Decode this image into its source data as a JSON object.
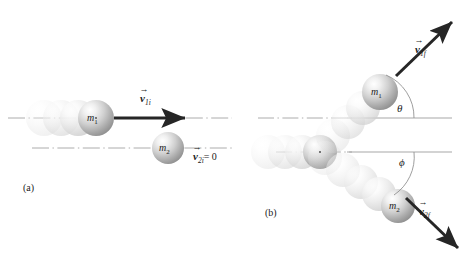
{
  "figure": {
    "type": "physics-diagram",
    "background_color": "#ffffff",
    "ink_color": "#1c1c1c",
    "sphere_color_dark": "#9a9a9a",
    "sphere_color_light": "#f2f2f2",
    "axis_color": "#9d9d9d"
  },
  "panels": [
    {
      "tag": "(a)",
      "caption_position": "bottom-left",
      "axes": [
        {
          "name": "m1-path-axis",
          "style": "dash-dot",
          "y": 118,
          "x1": 8,
          "x2": 232
        },
        {
          "name": "m2-path-axis",
          "style": "dash-dot",
          "y": 148,
          "x1": 32,
          "x2": 232
        }
      ],
      "balls": [
        {
          "label": "",
          "mass": "m1",
          "trail": true,
          "opacity": 0.12,
          "cx": 44,
          "cy": 118,
          "r": 18
        },
        {
          "label": "",
          "mass": "m1",
          "trail": true,
          "opacity": 0.28,
          "cx": 61,
          "cy": 118,
          "r": 18
        },
        {
          "label": "",
          "mass": "m1",
          "trail": true,
          "opacity": 0.52,
          "cx": 78,
          "cy": 118,
          "r": 18
        },
        {
          "label": "m1",
          "mass": "m1",
          "trail": false,
          "opacity": 1.0,
          "cx": 96,
          "cy": 118,
          "r": 18
        },
        {
          "label": "m2",
          "mass": "m2",
          "trail": false,
          "opacity": 1.0,
          "cx": 168,
          "cy": 148,
          "r": 16
        }
      ],
      "vectors": [
        {
          "name": "v1i",
          "label_html": "v1i",
          "x1": 114,
          "y1": 118,
          "x2": 188,
          "y2": 118,
          "thick": true
        }
      ],
      "labels": {
        "m1": "m",
        "m1_sub": "1",
        "m2": "m",
        "m2_sub": "2",
        "v1i_symbol": "v",
        "v1i_sub": "1i",
        "v2i_symbol": "v",
        "v2i_sub": "2i",
        "v2i_value": "= 0"
      }
    },
    {
      "tag": "(b)",
      "caption_position": "bottom-left",
      "axes": [
        {
          "name": "m1-reference-axis",
          "style": "solid",
          "y": 118,
          "x1": 345,
          "x2": 452
        },
        {
          "name": "m1-incoming-axis",
          "style": "dash-dot",
          "y": 118,
          "x1": 258,
          "x2": 352
        },
        {
          "name": "m2-reference-axis",
          "style": "solid",
          "y": 152,
          "x1": 345,
          "x2": 452
        },
        {
          "name": "m2-incoming-axis",
          "style": "dash-dot",
          "y": 152,
          "x1": 282,
          "x2": 352
        }
      ],
      "angles": [
        {
          "name": "theta",
          "symbol": "θ",
          "vertex_x": 415,
          "vertex_y": 118,
          "opens": "above-left",
          "measured_from": "horizontal"
        },
        {
          "name": "phi",
          "symbol": "ϕ",
          "vertex_x": 415,
          "vertex_y": 152,
          "opens": "below-left",
          "measured_from": "horizontal"
        }
      ],
      "vectors": [
        {
          "name": "v1f",
          "label_html": "v1f",
          "x1": 398,
          "y1": 74,
          "x2": 456,
          "y2": 18,
          "thick": true,
          "direction": "up-right"
        },
        {
          "name": "v2f",
          "label_html": "v2f",
          "x1": 404,
          "y1": 196,
          "x2": 462,
          "y2": 252,
          "thick": true,
          "direction": "down-right"
        }
      ],
      "labels": {
        "m1": "m",
        "m1_sub": "1",
        "m2": "m",
        "m2_sub": "2",
        "v1f_symbol": "v",
        "v1f_sub": "1f",
        "v2f_symbol": "v",
        "v2f_sub": "2f",
        "theta": "θ",
        "phi": "ϕ"
      }
    }
  ],
  "panel_a_tag": "(a)",
  "panel_b_tag": "(b)"
}
